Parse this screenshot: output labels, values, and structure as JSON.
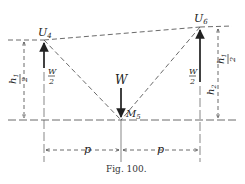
{
  "figure": {
    "caption": "Fig. 100.",
    "nodes": {
      "left_top": "U",
      "left_top_sub": "4",
      "right_top": "U",
      "right_top_sub": "6",
      "bottom_mid": "M",
      "bottom_mid_sub": "5"
    },
    "loads": {
      "center": "W",
      "left_num": "W",
      "left_den": "2",
      "right_num": "W",
      "right_den": "2"
    },
    "heights": {
      "left_num": "h",
      "left_num_sub": "1",
      "left_den": "2",
      "right_upper_num": "h",
      "right_upper_num_sub": "1",
      "right_upper_den": "2",
      "right_lower": "h",
      "right_lower_sub": "2"
    },
    "spans": {
      "left": "p",
      "right": "p"
    },
    "colors": {
      "ink": "#222222",
      "background": "#ffffff"
    }
  }
}
